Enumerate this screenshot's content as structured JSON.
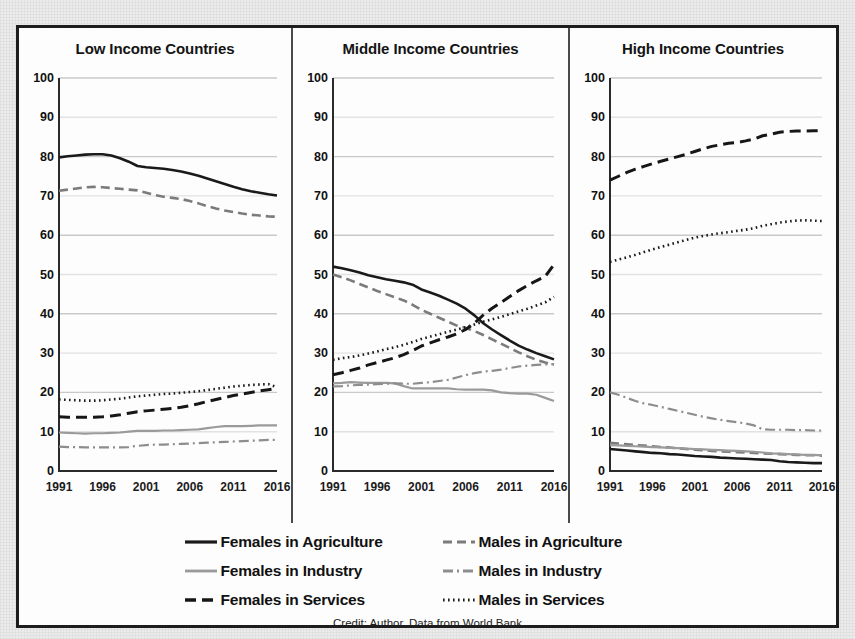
{
  "figure": {
    "caption": "Credit: Author, Data from World Bank",
    "panel_separator_color": "#4a4a4a",
    "border_color": "#1d1d1d"
  },
  "legend": {
    "rows": [
      [
        {
          "key": "solid-dark",
          "label": "Females in Agriculture"
        },
        {
          "key": "dash-gray",
          "label": "Males in Agriculture"
        }
      ],
      [
        {
          "key": "solid-gray",
          "label": "Females in Industry"
        },
        {
          "key": "dashdot-gray",
          "label": "Males in Industry"
        }
      ],
      [
        {
          "key": "dash-dark",
          "label": "Females  in Services"
        },
        {
          "key": "dot-dark",
          "label": "Males in Services"
        }
      ]
    ]
  },
  "chart_data": {
    "type": "line",
    "title": "",
    "xlabel": "",
    "ylabel": "",
    "xlim": [
      1991,
      2016
    ],
    "ylim": [
      0,
      100
    ],
    "yticks": [
      0,
      10,
      20,
      30,
      40,
      50,
      60,
      70,
      80,
      90,
      100
    ],
    "xticks": [
      1991,
      1996,
      2001,
      2006,
      2011,
      2016
    ],
    "grid": "horizontal",
    "legend_position": "bottom",
    "x": [
      1991,
      1992,
      1993,
      1994,
      1995,
      1996,
      1997,
      1998,
      1999,
      2000,
      2001,
      2002,
      2003,
      2004,
      2005,
      2006,
      2007,
      2008,
      2009,
      2010,
      2011,
      2012,
      2013,
      2014,
      2015,
      2016
    ],
    "panels": [
      {
        "title": "Low Income Countries",
        "series": [
          {
            "name": "Females in Agriculture",
            "key": "solid-dark",
            "values": [
              79.8,
              80.1,
              80.3,
              80.5,
              80.6,
              80.6,
              80.3,
              79.6,
              78.7,
              77.6,
              77.3,
              77.1,
              76.9,
              76.6,
              76.2,
              75.7,
              75.1,
              74.4,
              73.7,
              73.0,
              72.3,
              71.7,
              71.2,
              70.8,
              70.4,
              70.1
            ]
          },
          {
            "name": "Males in Agriculture",
            "key": "dash-gray",
            "values": [
              71.3,
              71.6,
              71.9,
              72.2,
              72.3,
              72.2,
              72.0,
              71.8,
              71.6,
              71.4,
              70.8,
              70.2,
              69.8,
              69.5,
              69.2,
              68.7,
              68.1,
              67.4,
              66.8,
              66.3,
              65.9,
              65.5,
              65.2,
              65.0,
              64.8,
              64.7
            ]
          },
          {
            "name": "Females in Industry",
            "key": "solid-gray",
            "values": [
              9.8,
              9.7,
              9.6,
              9.5,
              9.6,
              9.6,
              9.7,
              9.8,
              10.0,
              10.2,
              10.2,
              10.2,
              10.3,
              10.3,
              10.4,
              10.5,
              10.6,
              10.9,
              11.2,
              11.4,
              11.4,
              11.4,
              11.5,
              11.6,
              11.6,
              11.6
            ]
          },
          {
            "name": "Males in Industry",
            "key": "dashdot-gray",
            "values": [
              6.2,
              6.1,
              6.1,
              6.0,
              6.0,
              6.0,
              6.0,
              6.0,
              6.1,
              6.4,
              6.6,
              6.7,
              6.7,
              6.8,
              6.9,
              7.0,
              7.1,
              7.2,
              7.3,
              7.4,
              7.5,
              7.6,
              7.7,
              7.8,
              7.9,
              7.9
            ]
          },
          {
            "name": "Females in Services",
            "key": "dash-dark",
            "values": [
              13.8,
              13.7,
              13.7,
              13.7,
              13.7,
              13.8,
              14.0,
              14.3,
              14.7,
              15.1,
              15.3,
              15.5,
              15.7,
              15.9,
              16.2,
              16.6,
              17.1,
              17.7,
              18.2,
              18.7,
              19.2,
              19.6,
              20.0,
              20.4,
              20.7,
              21.0
            ]
          },
          {
            "name": "Males in Services",
            "key": "dot-dark",
            "values": [
              18.2,
              18.1,
              18.0,
              17.9,
              17.9,
              18.0,
              18.2,
              18.4,
              18.7,
              19.0,
              19.2,
              19.4,
              19.6,
              19.7,
              19.9,
              20.1,
              20.3,
              20.6,
              20.9,
              21.2,
              21.5,
              21.7,
              21.9,
              22.0,
              22.1,
              21.3
            ]
          }
        ]
      },
      {
        "title": "Middle Income Countries",
        "series": [
          {
            "name": "Females in Agriculture",
            "key": "solid-dark",
            "values": [
              52.0,
              51.6,
              51.1,
              50.5,
              49.8,
              49.3,
              48.8,
              48.4,
              48.0,
              47.4,
              46.2,
              45.4,
              44.6,
              43.6,
              42.6,
              41.3,
              39.6,
              37.6,
              36.0,
              34.6,
              33.2,
              31.9,
              30.9,
              30.0,
              29.2,
              28.4
            ]
          },
          {
            "name": "Males in Agriculture",
            "key": "dash-gray",
            "values": [
              50.0,
              49.3,
              48.5,
              47.6,
              46.7,
              45.8,
              45.0,
              44.2,
              43.4,
              42.3,
              41.0,
              40.0,
              39.0,
              38.0,
              37.0,
              36.4,
              35.6,
              34.6,
              33.5,
              32.4,
              31.3,
              30.2,
              29.2,
              28.3,
              27.6,
              27.1
            ]
          },
          {
            "name": "Females in Industry",
            "key": "solid-gray",
            "values": [
              22.3,
              22.4,
              22.6,
              22.5,
              22.4,
              22.4,
              22.4,
              22.3,
              21.6,
              21.0,
              21.0,
              21.0,
              21.0,
              21.0,
              20.8,
              20.7,
              20.7,
              20.7,
              20.5,
              20.0,
              19.8,
              19.7,
              19.7,
              19.4,
              18.6,
              17.8
            ]
          },
          {
            "name": "Males in Industry",
            "key": "dashdot-gray",
            "values": [
              21.5,
              21.6,
              21.8,
              21.9,
              22.0,
              22.1,
              22.2,
              22.3,
              22.2,
              22.2,
              22.4,
              22.6,
              22.9,
              23.2,
              23.8,
              24.4,
              24.9,
              25.3,
              25.5,
              25.8,
              26.2,
              26.6,
              26.8,
              27.0,
              27.1,
              27.2
            ]
          },
          {
            "name": "Females in Services",
            "key": "dash-dark",
            "values": [
              24.5,
              25.0,
              25.6,
              26.2,
              27.0,
              27.6,
              28.2,
              28.8,
              29.6,
              30.6,
              31.8,
              32.6,
              33.4,
              34.1,
              34.9,
              36.0,
              37.6,
              39.7,
              41.4,
              42.9,
              44.4,
              45.9,
              47.2,
              48.4,
              49.5,
              52.5
            ]
          },
          {
            "name": "Males in Services",
            "key": "dot-dark",
            "values": [
              28.3,
              28.7,
              29.0,
              29.4,
              29.9,
              30.4,
              31.0,
              31.5,
              32.1,
              32.8,
              33.6,
              34.2,
              34.8,
              35.4,
              36.0,
              36.6,
              37.3,
              38.0,
              38.6,
              39.2,
              39.9,
              40.6,
              41.3,
              42.1,
              42.9,
              44.3
            ]
          }
        ]
      },
      {
        "title": "High Income Countries",
        "series": [
          {
            "name": "Females in Agriculture",
            "key": "solid-dark",
            "values": [
              5.6,
              5.4,
              5.2,
              5.0,
              4.8,
              4.6,
              4.5,
              4.3,
              4.2,
              4.0,
              3.8,
              3.7,
              3.6,
              3.4,
              3.3,
              3.2,
              3.1,
              3.0,
              2.9,
              2.8,
              2.5,
              2.3,
              2.2,
              2.1,
              2.0,
              2.0
            ]
          },
          {
            "name": "Males in Agriculture",
            "key": "dash-gray",
            "values": [
              7.2,
              7.0,
              6.8,
              6.6,
              6.5,
              6.3,
              6.1,
              6.0,
              5.8,
              5.6,
              5.4,
              5.3,
              5.1,
              5.0,
              4.9,
              4.8,
              4.7,
              4.6,
              4.5,
              4.4,
              4.3,
              4.2,
              4.1,
              4.0,
              4.0,
              3.9
            ]
          },
          {
            "name": "Females in Industry",
            "key": "solid-gray",
            "values": [
              6.6,
              6.5,
              6.4,
              6.3,
              6.2,
              6.1,
              6.0,
              5.9,
              5.8,
              5.7,
              5.6,
              5.5,
              5.4,
              5.3,
              5.2,
              5.1,
              5.0,
              4.9,
              4.7,
              4.5,
              4.4,
              4.3,
              4.2,
              4.1,
              4.1,
              4.0
            ]
          },
          {
            "name": "Males in Industry",
            "key": "dashdot-gray",
            "values": [
              20.0,
              19.4,
              18.6,
              17.8,
              17.2,
              16.8,
              16.3,
              15.8,
              15.3,
              14.8,
              14.3,
              13.8,
              13.4,
              13.0,
              12.7,
              12.4,
              12.1,
              11.6,
              10.6,
              10.5,
              10.5,
              10.5,
              10.4,
              10.4,
              10.3,
              10.3
            ]
          },
          {
            "name": "Females in Services",
            "key": "dash-dark",
            "values": [
              74.0,
              75.0,
              76.0,
              76.8,
              77.5,
              78.2,
              78.8,
              79.4,
              80.0,
              80.6,
              81.3,
              82.0,
              82.6,
              83.0,
              83.4,
              83.6,
              84.0,
              84.5,
              85.3,
              85.7,
              86.2,
              86.4,
              86.5,
              86.5,
              86.6,
              86.6
            ]
          },
          {
            "name": "Males in Services",
            "key": "dot-dark",
            "values": [
              53.2,
              53.8,
              54.4,
              55.0,
              55.7,
              56.4,
              57.0,
              57.6,
              58.2,
              58.8,
              59.4,
              59.8,
              60.2,
              60.5,
              60.8,
              61.1,
              61.4,
              61.8,
              62.4,
              62.8,
              63.2,
              63.5,
              63.7,
              63.8,
              63.7,
              63.6
            ]
          }
        ]
      }
    ]
  }
}
